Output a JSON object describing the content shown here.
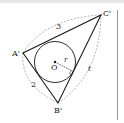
{
  "figure": {
    "vertices": {
      "A": {
        "label": "A'",
        "x": 23,
        "y": 53
      },
      "B": {
        "label": "B'",
        "x": 58,
        "y": 103
      },
      "C": {
        "label": "C'",
        "x": 101,
        "y": 15
      }
    },
    "center": {
      "label": "O",
      "x": 55,
      "y": 62
    },
    "incircle_radius_label": "r",
    "edge_labels": {
      "AC": "3",
      "AB": "2",
      "BC": "t"
    },
    "colors": {
      "stroke": "#1a1a1a",
      "dashed": "#9a9a9a",
      "rule": "#9a9a9a"
    }
  }
}
